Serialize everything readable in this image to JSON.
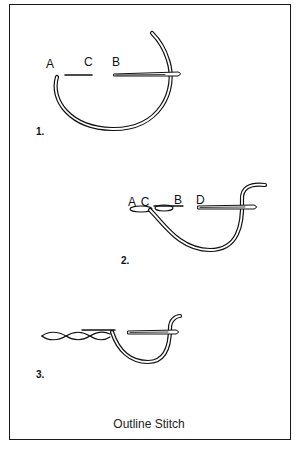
{
  "figure": {
    "caption": "Outline Stitch",
    "steps": [
      {
        "number": "1.",
        "point_labels": [
          "A",
          "C",
          "B"
        ]
      },
      {
        "number": "2.",
        "point_labels": [
          "A C",
          "B",
          "D"
        ]
      },
      {
        "number": "3.",
        "point_labels": []
      }
    ]
  },
  "colors": {
    "ink": "#111111",
    "background": "#ffffff"
  }
}
